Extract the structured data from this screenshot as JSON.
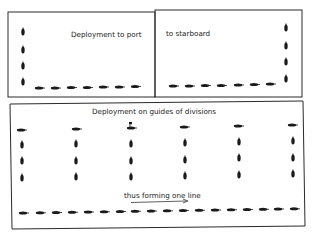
{
  "diagram": {
    "panels": [
      {
        "id": "port",
        "title": "Deployment to port",
        "ships_vertical": 4,
        "ships_horizontal": 7
      },
      {
        "id": "starboard",
        "title": "to starboard",
        "ships_vertical": 4,
        "ships_horizontal": 7
      },
      {
        "id": "guides",
        "title": "Deployment on guides of divisions",
        "columns": 6,
        "ships_per_column": 4,
        "arrow_label": "thus forming one line",
        "line_ships": 18
      }
    ],
    "colors": {
      "ink": "#1a1a1a",
      "border": "#2a2a2a",
      "background": "#ffffff"
    }
  }
}
